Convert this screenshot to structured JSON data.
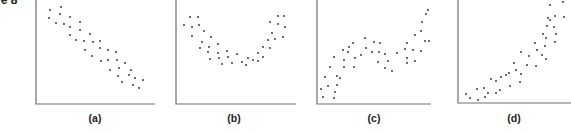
{
  "figure": {
    "title_fragment": "re 8"
  },
  "chart_data": [
    {
      "type": "scatter",
      "label": "(a)",
      "title": "",
      "xlabel": "",
      "ylabel": "",
      "grid": false,
      "description": "strong negative linear relationship",
      "axes": {
        "y_axis_x": 36,
        "baseline_y": 104,
        "x_end": 155,
        "top": 0
      },
      "label_pos": [
        95,
        122
      ],
      "points": [
        [
          50,
          10
        ],
        [
          61,
          7
        ],
        [
          49,
          18
        ],
        [
          60,
          14
        ],
        [
          70,
          17
        ],
        [
          56,
          23
        ],
        [
          64,
          24
        ],
        [
          70,
          27
        ],
        [
          80,
          22
        ],
        [
          70,
          35
        ],
        [
          80,
          30
        ],
        [
          90,
          34
        ],
        [
          76,
          40
        ],
        [
          84,
          41
        ],
        [
          93,
          42
        ],
        [
          100,
          41
        ],
        [
          85,
          50
        ],
        [
          100,
          48
        ],
        [
          108,
          50
        ],
        [
          116,
          52
        ],
        [
          92,
          56
        ],
        [
          101,
          61
        ],
        [
          108,
          60
        ],
        [
          117,
          60
        ],
        [
          125,
          63
        ],
        [
          110,
          70
        ],
        [
          119,
          68
        ],
        [
          131,
          70
        ],
        [
          118,
          76
        ],
        [
          129,
          75
        ],
        [
          135,
          78
        ],
        [
          143,
          80
        ],
        [
          122,
          82
        ],
        [
          133,
          85
        ],
        [
          139,
          88
        ]
      ]
    },
    {
      "type": "scatter",
      "label": "(b)",
      "title": "",
      "xlabel": "",
      "ylabel": "",
      "grid": false,
      "description": "U-shaped (quadratic) relationship",
      "axes": {
        "y_axis_x": 176,
        "baseline_y": 104,
        "x_end": 296,
        "top": 0
      },
      "label_pos": [
        234,
        122
      ],
      "points": [
        [
          190,
          17
        ],
        [
          198,
          17
        ],
        [
          184,
          25
        ],
        [
          192,
          27
        ],
        [
          199,
          25
        ],
        [
          192,
          36
        ],
        [
          204,
          31
        ],
        [
          211,
          37
        ],
        [
          202,
          42
        ],
        [
          209,
          47
        ],
        [
          218,
          44
        ],
        [
          200,
          48
        ],
        [
          208,
          52
        ],
        [
          218,
          53
        ],
        [
          227,
          51
        ],
        [
          219,
          58
        ],
        [
          228,
          57
        ],
        [
          237,
          54
        ],
        [
          210,
          59
        ],
        [
          222,
          64
        ],
        [
          232,
          63
        ],
        [
          242,
          62
        ],
        [
          248,
          58
        ],
        [
          258,
          61
        ],
        [
          246,
          65
        ],
        [
          253,
          60
        ],
        [
          263,
          57
        ],
        [
          263,
          47
        ],
        [
          270,
          48
        ],
        [
          258,
          53
        ],
        [
          268,
          40
        ],
        [
          275,
          39
        ],
        [
          272,
          33
        ],
        [
          283,
          37
        ],
        [
          278,
          24
        ],
        [
          285,
          27
        ],
        [
          284,
          16
        ],
        [
          278,
          16
        ],
        [
          270,
          22
        ]
      ]
    },
    {
      "type": "scatter",
      "label": "(c)",
      "title": "",
      "xlabel": "",
      "ylabel": "",
      "grid": false,
      "description": "positive trend with non-linear (cubic-like) wave",
      "axes": {
        "y_axis_x": 317,
        "baseline_y": 104,
        "x_end": 431,
        "top": 0
      },
      "label_pos": [
        374,
        122
      ],
      "points": [
        [
          321,
          89
        ],
        [
          323,
          97
        ],
        [
          325,
          77
        ],
        [
          328,
          86
        ],
        [
          330,
          67
        ],
        [
          334,
          57
        ],
        [
          337,
          76
        ],
        [
          337,
          85
        ],
        [
          335,
          92
        ],
        [
          334,
          98
        ],
        [
          340,
          78
        ],
        [
          343,
          50
        ],
        [
          344,
          60
        ],
        [
          344,
          67
        ],
        [
          349,
          47
        ],
        [
          348,
          52
        ],
        [
          353,
          43
        ],
        [
          355,
          58
        ],
        [
          354,
          67
        ],
        [
          361,
          55
        ],
        [
          365,
          38
        ],
        [
          366,
          48
        ],
        [
          372,
          52
        ],
        [
          374,
          42
        ],
        [
          378,
          62
        ],
        [
          380,
          43
        ],
        [
          379,
          52
        ],
        [
          385,
          54
        ],
        [
          385,
          68
        ],
        [
          388,
          61
        ],
        [
          392,
          71
        ],
        [
          397,
          53
        ],
        [
          405,
          49
        ],
        [
          407,
          43
        ],
        [
          407,
          58
        ],
        [
          407,
          63
        ],
        [
          413,
          50
        ],
        [
          415,
          35
        ],
        [
          415,
          61
        ],
        [
          421,
          31
        ],
        [
          422,
          22
        ],
        [
          421,
          51
        ],
        [
          425,
          41
        ],
        [
          426,
          14
        ],
        [
          428,
          10
        ],
        [
          429,
          41
        ]
      ]
    },
    {
      "type": "scatter",
      "label": "(d)",
      "title": "",
      "xlabel": "",
      "ylabel": "",
      "grid": false,
      "description": "positive curvilinear (exponential-like) relationship",
      "axes": {
        "y_axis_x": 458,
        "baseline_y": 103,
        "x_end": 571,
        "top": 0
      },
      "label_pos": [
        514,
        122
      ],
      "points": [
        [
          466,
          94
        ],
        [
          470,
          98
        ],
        [
          477,
          89
        ],
        [
          478,
          100
        ],
        [
          484,
          88
        ],
        [
          485,
          97
        ],
        [
          488,
          93
        ],
        [
          491,
          79
        ],
        [
          496,
          81
        ],
        [
          496,
          93
        ],
        [
          500,
          90
        ],
        [
          501,
          77
        ],
        [
          506,
          75
        ],
        [
          509,
          73
        ],
        [
          510,
          86
        ],
        [
          514,
          63
        ],
        [
          516,
          70
        ],
        [
          520,
          82
        ],
        [
          521,
          74
        ],
        [
          521,
          52
        ],
        [
          527,
          65
        ],
        [
          529,
          56
        ],
        [
          535,
          43
        ],
        [
          536,
          66
        ],
        [
          537,
          50
        ],
        [
          542,
          55
        ],
        [
          543,
          34
        ],
        [
          545,
          46
        ],
        [
          546,
          38
        ],
        [
          546,
          59
        ],
        [
          547,
          26
        ],
        [
          548,
          18
        ],
        [
          550,
          20
        ],
        [
          550,
          5
        ],
        [
          554,
          27
        ],
        [
          555,
          42
        ],
        [
          556,
          34
        ],
        [
          555,
          16
        ],
        [
          563,
          2
        ],
        [
          564,
          17
        ]
      ]
    }
  ]
}
